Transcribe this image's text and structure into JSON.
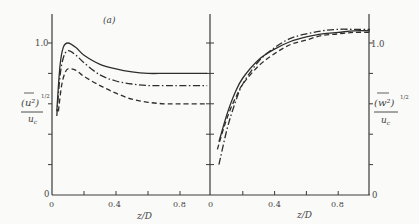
{
  "chart_data": [
    {
      "type": "line",
      "panel": "left",
      "title": "(a)",
      "xlabel": "z/D",
      "ylabel": "(u²)^1/2 / u_c",
      "ylabel_parts": {
        "num": "(u²)",
        "exp": "1/2",
        "den": "u_c"
      },
      "xlim": [
        0,
        0.97
      ],
      "ylim": [
        0,
        1.15
      ],
      "xticks": [
        0,
        0.2,
        0.4,
        0.6,
        0.8
      ],
      "xtick_labels": [
        "0",
        "0.4",
        "0.8"
      ],
      "yticks": [
        0,
        0.2,
        0.4,
        0.6,
        0.8,
        1.0
      ],
      "ytick_labels": [
        "0",
        "1.0"
      ],
      "grid": false,
      "series": [
        {
          "name": "solid",
          "style": "solid",
          "x": [
            0.03,
            0.05,
            0.07,
            0.1,
            0.15,
            0.2,
            0.3,
            0.4,
            0.5,
            0.6,
            0.7,
            0.8,
            0.97
          ],
          "y": [
            0.55,
            0.85,
            0.97,
            1.0,
            0.97,
            0.92,
            0.86,
            0.83,
            0.81,
            0.8,
            0.8,
            0.8,
            0.8
          ]
        },
        {
          "name": "dash-dot",
          "style": "dashdot",
          "x": [
            0.03,
            0.05,
            0.07,
            0.1,
            0.15,
            0.2,
            0.3,
            0.4,
            0.5,
            0.6,
            0.7,
            0.8,
            0.97
          ],
          "y": [
            0.52,
            0.78,
            0.9,
            0.95,
            0.92,
            0.87,
            0.79,
            0.75,
            0.73,
            0.72,
            0.72,
            0.72,
            0.72
          ]
        },
        {
          "name": "dashed",
          "style": "dashed",
          "x": [
            0.04,
            0.06,
            0.08,
            0.1,
            0.15,
            0.2,
            0.3,
            0.4,
            0.5,
            0.6,
            0.7,
            0.8,
            0.97
          ],
          "y": [
            0.55,
            0.72,
            0.8,
            0.83,
            0.82,
            0.78,
            0.72,
            0.67,
            0.63,
            0.61,
            0.6,
            0.6,
            0.6
          ]
        }
      ]
    },
    {
      "type": "line",
      "panel": "right",
      "xlabel": "z/D",
      "ylabel": "(w²)^1/2 / u_c",
      "ylabel_parts": {
        "num": "(w²)",
        "exp": "1/2",
        "den": "u_c"
      },
      "xlim": [
        0,
        1.0
      ],
      "ylim": [
        0,
        1.15
      ],
      "xticks": [
        0,
        0.2,
        0.4,
        0.6,
        0.8
      ],
      "xtick_labels": [
        "0",
        "0.4",
        "0.8"
      ],
      "yticks": [
        0,
        0.2,
        0.4,
        0.6,
        0.8,
        1.0
      ],
      "ytick_labels": [
        "0",
        "1.0"
      ],
      "grid": false,
      "series": [
        {
          "name": "solid",
          "style": "solid",
          "x": [
            0.05,
            0.1,
            0.15,
            0.2,
            0.3,
            0.4,
            0.5,
            0.6,
            0.7,
            0.8,
            0.9,
            1.0
          ],
          "y": [
            0.35,
            0.53,
            0.67,
            0.77,
            0.89,
            0.96,
            1.01,
            1.04,
            1.06,
            1.07,
            1.08,
            1.08
          ]
        },
        {
          "name": "dash-dot",
          "style": "dashdot",
          "x": [
            0.05,
            0.1,
            0.15,
            0.2,
            0.3,
            0.4,
            0.5,
            0.6,
            0.7,
            0.8,
            0.9,
            1.0
          ],
          "y": [
            0.2,
            0.43,
            0.6,
            0.73,
            0.88,
            0.97,
            1.03,
            1.06,
            1.08,
            1.09,
            1.09,
            1.09
          ]
        },
        {
          "name": "dashed",
          "style": "dashed",
          "x": [
            0.04,
            0.08,
            0.12,
            0.16,
            0.2,
            0.3,
            0.4,
            0.5,
            0.6,
            0.7,
            0.8,
            0.9,
            1.0
          ],
          "y": [
            0.3,
            0.44,
            0.56,
            0.65,
            0.73,
            0.85,
            0.93,
            0.99,
            1.02,
            1.05,
            1.06,
            1.07,
            1.07
          ]
        }
      ]
    }
  ],
  "labels": {
    "panel_tag": "(a)",
    "xlabel_left": "z/D",
    "xlabel_right": "z/D",
    "ytick_one_left": "1.0",
    "ytick_zero_left": "0",
    "ytick_one_right": "1.0",
    "ytick_zero_right": "0",
    "xtick_left": [
      "0",
      "0.4",
      "0.8"
    ],
    "xtick_right": [
      "0",
      "0.4",
      "0.8"
    ],
    "ylabel_left_num": "(u²)",
    "ylabel_left_exp": "1/2",
    "ylabel_left_den": "u",
    "ylabel_left_sub": "c",
    "ylabel_right_num": "(w²)",
    "ylabel_right_exp": "1/2",
    "ylabel_right_den": "u",
    "ylabel_right_sub": "c"
  },
  "colors": {
    "ink": "#3a3a3a",
    "background": "#fafaf8"
  }
}
